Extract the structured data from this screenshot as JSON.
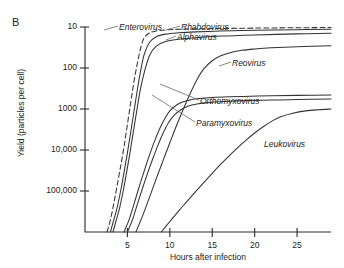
{
  "figure": {
    "panel_label": "B",
    "ylabel": "Yield (particles per cell)",
    "xlabel": "Hours after infection"
  },
  "axes": {
    "y_ticks": [
      "100,000",
      "10,000",
      "1000",
      "100",
      "10"
    ],
    "x_ticks": [
      "5",
      "10",
      "15",
      "20",
      "25"
    ]
  },
  "series_labels": {
    "enterovirus": "Enterovirus",
    "rhabdovirus": "Rhabdovirus",
    "alphavirus": "Alphavirus",
    "reovirus": "Reovirus",
    "orthomyxovirus": "Orthomyxovirus",
    "paramyxovirus": "Paramyxovirus",
    "leukovirus": "Leukovirus"
  },
  "chart_data": {
    "type": "line",
    "title": "B",
    "xlabel": "Hours after infection",
    "ylabel": "Yield (particles per cell)",
    "yscale": "log",
    "ylim": [
      1,
      100000
    ],
    "xlim": [
      0,
      29
    ],
    "y_tick_values": [
      10,
      100,
      1000,
      10000,
      100000
    ],
    "y_tick_labels": [
      "10",
      "100",
      "1000",
      "10,000",
      "100,000"
    ],
    "x_tick_values": [
      5,
      10,
      15,
      20,
      25
    ],
    "x_tick_labels": [
      "5",
      "10",
      "15",
      "20",
      "25"
    ],
    "grid": false,
    "legend": "inline-annotations",
    "line_color": "#333333",
    "series": [
      {
        "name": "Enterovirus",
        "style": "dashed",
        "label_position": "top-left",
        "x": [
          2.6,
          3.0,
          3.4,
          3.8,
          4.2,
          4.6,
          5.0,
          5.4,
          5.8,
          6.2,
          6.6,
          7.0,
          7.6,
          8.4,
          9.5,
          11.0,
          13.0,
          16.0,
          20.0,
          25.0,
          29.0
        ],
        "y": [
          1,
          2,
          5,
          14,
          40,
          120,
          420,
          1500,
          5000,
          14000,
          33000,
          55000,
          72000,
          80000,
          85000,
          88000,
          90000,
          92000,
          94000,
          96000,
          97000
        ]
      },
      {
        "name": "Rhabdovirus",
        "style": "solid",
        "label_position": "top-right",
        "x": [
          3.0,
          3.4,
          3.8,
          4.2,
          4.6,
          5.0,
          5.4,
          5.8,
          6.2,
          6.6,
          7.0,
          7.6,
          8.4,
          9.5,
          11.0,
          13.0,
          16.0,
          20.0,
          25.0,
          29.0
        ],
        "y": [
          1,
          2,
          4,
          10,
          28,
          85,
          280,
          950,
          3200,
          9500,
          22000,
          42000,
          58000,
          67000,
          72000,
          76000,
          80000,
          83000,
          86000,
          88000
        ]
      },
      {
        "name": "Alphavirus",
        "style": "solid",
        "label_position": "top-right",
        "x": [
          3.3,
          3.7,
          4.1,
          4.5,
          4.9,
          5.3,
          5.7,
          6.1,
          6.5,
          7.0,
          7.6,
          8.4,
          9.5,
          11.0,
          13.0,
          16.0,
          20.0,
          25.0,
          29.0
        ],
        "y": [
          1,
          2,
          4,
          10,
          28,
          85,
          280,
          900,
          2800,
          8000,
          20000,
          34000,
          44000,
          50000,
          55000,
          60000,
          64000,
          68000,
          70000
        ]
      },
      {
        "name": "Orthomyxovirus",
        "style": "solid",
        "label_position": "middle-right",
        "x": [
          4.6,
          5.2,
          5.8,
          6.4,
          7.0,
          7.6,
          8.2,
          8.8,
          9.4,
          10.0,
          10.8,
          11.6,
          12.5,
          13.5,
          15.0,
          17.0,
          19.5,
          22.0,
          25.0,
          29.0
        ],
        "y": [
          1,
          2,
          5,
          13,
          32,
          75,
          165,
          330,
          580,
          900,
          1250,
          1500,
          1680,
          1800,
          1900,
          1980,
          2050,
          2100,
          2150,
          2200
        ]
      },
      {
        "name": "Paramyxovirus",
        "style": "solid",
        "label_position": "middle-right",
        "x": [
          5.0,
          5.6,
          6.2,
          6.8,
          7.4,
          8.0,
          8.6,
          9.2,
          9.8,
          10.5,
          11.3,
          12.2,
          13.2,
          14.5,
          16.5,
          19.0,
          22.0,
          25.0,
          29.0
        ],
        "y": [
          1,
          2,
          5,
          12,
          28,
          62,
          130,
          255,
          450,
          700,
          960,
          1180,
          1320,
          1430,
          1520,
          1600,
          1650,
          1700,
          1750
        ]
      },
      {
        "name": "Reovirus",
        "style": "solid",
        "label_position": "upper-right",
        "x": [
          6.0,
          6.8,
          7.6,
          8.4,
          9.2,
          10.0,
          10.8,
          11.6,
          12.4,
          13.2,
          14.0,
          15.0,
          16.0,
          17.2,
          18.5,
          20.0,
          22.0,
          25.0,
          29.0
        ],
        "y": [
          1,
          2.5,
          7,
          20,
          55,
          150,
          400,
          1000,
          2400,
          5200,
          9500,
          15000,
          20000,
          24000,
          27000,
          29000,
          31000,
          33000,
          35000
        ]
      },
      {
        "name": "Leukovirus",
        "style": "solid",
        "label_position": "lower-right",
        "x": [
          9.0,
          10.0,
          11.0,
          12.0,
          13.0,
          14.0,
          15.0,
          16.0,
          17.0,
          18.0,
          19.0,
          20.0,
          21.0,
          22.0,
          23.0,
          24.5,
          26.0,
          27.5,
          29.0
        ],
        "y": [
          1,
          1.8,
          3.2,
          5.5,
          9.5,
          16,
          27,
          45,
          72,
          115,
          175,
          260,
          370,
          500,
          640,
          790,
          900,
          960,
          1000
        ]
      }
    ]
  }
}
